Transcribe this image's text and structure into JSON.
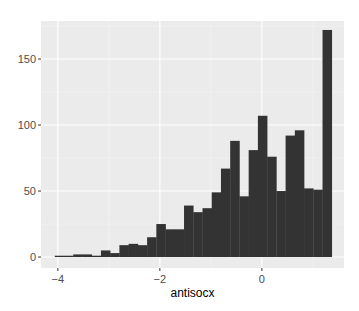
{
  "chart_data": {
    "type": "bar",
    "subtype": "histogram",
    "title": "",
    "xlabel": "antisocx",
    "ylabel": "",
    "xlim": [
      -4.33,
      1.61
    ],
    "ylim": [
      -8.3,
      178.8
    ],
    "x_ticks": [
      -4,
      -2,
      0
    ],
    "x_tick_labels": [
      "-4",
      "-2",
      "0"
    ],
    "y_ticks": [
      0,
      50,
      100,
      150
    ],
    "y_tick_labels": [
      "0",
      "50",
      "100",
      "150"
    ],
    "grid": true,
    "legend": null,
    "bin_width": 0.181,
    "bin_start": -4.06,
    "counts": [
      1,
      1,
      2,
      2,
      1,
      5,
      3,
      9,
      10,
      9,
      15,
      25,
      21,
      21,
      39,
      34,
      37,
      49,
      67,
      88,
      46,
      81,
      107,
      76,
      50,
      92,
      96,
      52,
      51,
      172
    ],
    "colors": {
      "panel_background": "#ebebeb",
      "grid_major": "#ffffff",
      "grid_minor": "#f5f5f5",
      "bar_fill": "#333333",
      "tick_text": "#4d4d4d",
      "axis_title": "#000000"
    }
  },
  "layout": {
    "panel": {
      "x": 41,
      "y": 21,
      "width": 303,
      "height": 247
    }
  }
}
